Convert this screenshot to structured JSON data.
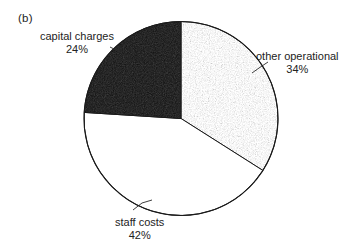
{
  "figure": {
    "panel_label": "(b)",
    "background_color": "#ffffff",
    "outline_color": "#1a1a1a"
  },
  "chart_data": {
    "type": "pie",
    "title": "",
    "subtitle": "",
    "xlabel": "",
    "ylabel": "",
    "legend_position": "none",
    "grid": false,
    "labels_inline": true,
    "start_angle_deg": 0,
    "direction": "clockwise",
    "center": {
      "x": 181,
      "y": 118.5
    },
    "radius": 97,
    "categories": [
      "other operational",
      "staff costs",
      "capital charges"
    ],
    "values": [
      34,
      42,
      24
    ],
    "value_unit": "%",
    "slices": [
      {
        "label": "other operational",
        "value": 34,
        "value_text": "34%",
        "fill_style": "stipple-gray",
        "fill_color": "#969696",
        "start_angle_deg": 0,
        "end_angle_deg": 122.4
      },
      {
        "label": "staff costs",
        "value": 42,
        "value_text": "42%",
        "fill_style": "solid-white",
        "fill_color": "#ffffff",
        "start_angle_deg": 122.4,
        "end_angle_deg": 273.6
      },
      {
        "label": "capital charges",
        "value": 24,
        "value_text": "24%",
        "fill_style": "solid-black",
        "fill_color": "#141414",
        "start_angle_deg": 273.6,
        "end_angle_deg": 360
      }
    ]
  }
}
